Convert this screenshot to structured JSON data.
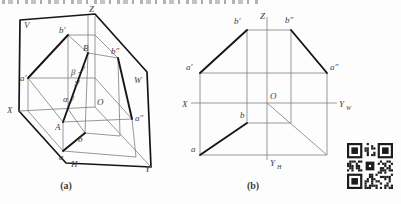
{
  "colors": {
    "background": "#fdfdfd",
    "line_bold": "#161616",
    "line_thin": "#7d7d7d",
    "label": "#3f3f3f",
    "qr_dark": "#1c1c1c"
  },
  "figure_a": {
    "caption": "(a)",
    "labels": {
      "plane_v": "V",
      "plane_w": "W",
      "plane_h": "H",
      "axis_x": "X",
      "axis_y": "Y",
      "axis_z": "Z",
      "origin": "O",
      "point_A": "A",
      "point_B": "B",
      "point_a": "a",
      "point_b": "b",
      "point_a1": "a′",
      "point_b1": "b′",
      "point_a2": "a″",
      "point_b2": "b″",
      "angle_alpha": "α",
      "angle_beta": "β",
      "angle_gamma": "γ"
    }
  },
  "figure_b": {
    "caption": "(b)",
    "labels": {
      "axis_x": "X",
      "axis_z": "Z",
      "origin": "O",
      "axis_yw_base": "Y",
      "axis_yw_sub": "W",
      "axis_yh_base": "Y",
      "axis_yh_sub": "H",
      "point_a": "a",
      "point_b": "b",
      "point_a1": "a′",
      "point_b1": "b′",
      "point_a2": "a″",
      "point_b2": "b″"
    }
  }
}
